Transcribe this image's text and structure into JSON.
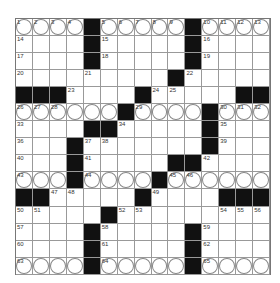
{
  "puzzle": {
    "size": 15,
    "rows": [
      "....#.....#....",
      "....#.....#....",
      "....#.....#....",
      ".........#.....",
      "###.......#...##",
      "......#.....#...",
      "....##.....#...",
      "...#.......#...",
      "...#....##.....",
      "...#....#......",
      "##.....#....###",
      ".....#.........",
      "....#.....#....",
      "....#.....#....",
      "....#.....#...."
    ],
    "black": [
      [
        0,
        4
      ],
      [
        0,
        10
      ],
      [
        1,
        4
      ],
      [
        1,
        10
      ],
      [
        2,
        4
      ],
      [
        2,
        10
      ],
      [
        3,
        9
      ],
      [
        4,
        0
      ],
      [
        4,
        1
      ],
      [
        4,
        2
      ],
      [
        4,
        7
      ],
      [
        4,
        13
      ],
      [
        4,
        14
      ],
      [
        5,
        6
      ],
      [
        5,
        11
      ],
      [
        6,
        4
      ],
      [
        6,
        5
      ],
      [
        6,
        11
      ],
      [
        7,
        3
      ],
      [
        7,
        11
      ],
      [
        8,
        3
      ],
      [
        8,
        9
      ],
      [
        8,
        10
      ],
      [
        9,
        3
      ],
      [
        9,
        8
      ],
      [
        10,
        0
      ],
      [
        10,
        1
      ],
      [
        10,
        7
      ],
      [
        10,
        12
      ],
      [
        10,
        13
      ],
      [
        10,
        14
      ],
      [
        11,
        5
      ],
      [
        12,
        4
      ],
      [
        12,
        10
      ],
      [
        13,
        4
      ],
      [
        13,
        10
      ],
      [
        14,
        4
      ],
      [
        14,
        10
      ]
    ],
    "circled_rows": [
      0,
      5,
      9,
      14
    ],
    "numbers": [
      [
        0,
        0,
        "1"
      ],
      [
        0,
        1,
        "2"
      ],
      [
        0,
        2,
        "3"
      ],
      [
        0,
        3,
        "4"
      ],
      [
        0,
        5,
        "5"
      ],
      [
        0,
        6,
        "6"
      ],
      [
        0,
        7,
        "7"
      ],
      [
        0,
        8,
        "8"
      ],
      [
        0,
        9,
        "9"
      ],
      [
        0,
        11,
        "10"
      ],
      [
        0,
        12,
        "11"
      ],
      [
        0,
        13,
        "12"
      ],
      [
        0,
        14,
        "13"
      ],
      [
        1,
        0,
        "14"
      ],
      [
        1,
        5,
        "15"
      ],
      [
        1,
        11,
        "16"
      ],
      [
        2,
        0,
        "17"
      ],
      [
        2,
        5,
        "18"
      ],
      [
        2,
        11,
        "19"
      ],
      [
        3,
        0,
        "20"
      ],
      [
        3,
        4,
        "21"
      ],
      [
        3,
        10,
        "22"
      ],
      [
        4,
        3,
        "23"
      ],
      [
        4,
        8,
        "24"
      ],
      [
        4,
        9,
        "25"
      ],
      [
        5,
        0,
        "26"
      ],
      [
        5,
        1,
        "27"
      ],
      [
        5,
        2,
        "28"
      ],
      [
        5,
        7,
        "29"
      ],
      [
        5,
        12,
        "30"
      ],
      [
        5,
        13,
        "31"
      ],
      [
        5,
        14,
        "32"
      ],
      [
        6,
        0,
        "33"
      ],
      [
        6,
        6,
        "34"
      ],
      [
        6,
        12,
        "35"
      ],
      [
        7,
        0,
        "36"
      ],
      [
        7,
        4,
        "37"
      ],
      [
        7,
        5,
        "38"
      ],
      [
        7,
        12,
        "39"
      ],
      [
        8,
        0,
        "40"
      ],
      [
        8,
        4,
        "41"
      ],
      [
        8,
        11,
        "42"
      ],
      [
        9,
        0,
        "43"
      ],
      [
        9,
        4,
        "44"
      ],
      [
        9,
        9,
        "45"
      ],
      [
        9,
        10,
        "46"
      ],
      [
        10,
        2,
        "47"
      ],
      [
        10,
        3,
        "48"
      ],
      [
        10,
        8,
        "49"
      ],
      [
        11,
        0,
        "50"
      ],
      [
        11,
        1,
        "51"
      ],
      [
        11,
        6,
        "52"
      ],
      [
        11,
        7,
        "53"
      ],
      [
        11,
        12,
        "54"
      ],
      [
        11,
        13,
        "55"
      ],
      [
        11,
        14,
        "56"
      ],
      [
        12,
        0,
        "57"
      ],
      [
        12,
        5,
        "58"
      ],
      [
        12,
        11,
        "59"
      ],
      [
        13,
        0,
        "60"
      ],
      [
        13,
        5,
        "61"
      ],
      [
        13,
        11,
        "62"
      ],
      [
        14,
        0,
        "63"
      ],
      [
        14,
        5,
        "64"
      ],
      [
        14,
        11,
        "65"
      ]
    ]
  }
}
